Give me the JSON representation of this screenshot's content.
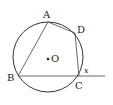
{
  "diagram": {
    "type": "geometry-circle-inscribed-quadrilateral",
    "colors": {
      "stroke": "#333333",
      "background": "#ffffff"
    },
    "circle": {
      "cx": 48,
      "cy": 57,
      "r": 35
    },
    "center": {
      "label": "O",
      "x": 47,
      "y": 59
    },
    "points": {
      "A": {
        "label": "A",
        "x": 48,
        "y": 22
      },
      "B": {
        "label": "B",
        "x": 18,
        "y": 76
      },
      "C": {
        "label": "C",
        "x": 79,
        "y": 76
      },
      "D": {
        "label": "D",
        "x": 75,
        "y": 33
      }
    },
    "extension": {
      "from": "B",
      "to_x": 105,
      "y": 76
    },
    "angle_label": "x"
  }
}
